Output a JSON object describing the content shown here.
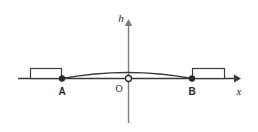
{
  "figure": {
    "background_color": "#ffffff",
    "line_color": "#3a3a3a",
    "label_color": "#2b2b2b"
  },
  "axes": {
    "horizontal": {
      "label": "x",
      "name": "x-axis",
      "x_start": 18,
      "x_end": 240,
      "y": 78,
      "arrow": "right"
    },
    "vertical": {
      "label": "h",
      "name": "h-axis",
      "x": 128,
      "y_top": 20,
      "y_bottom": 123,
      "arrow": "up"
    }
  },
  "origin": {
    "label": "O",
    "marker": "open-circle",
    "x": 128,
    "y": 78,
    "radius": 3
  },
  "points": [
    {
      "label": "A",
      "name": "point-a",
      "x": 62,
      "y": 78,
      "marker": "filled-circle"
    },
    {
      "label": "B",
      "name": "point-b",
      "x": 192,
      "y": 78,
      "marker": "filled-circle"
    }
  ],
  "supports": [
    {
      "name": "left-support-block",
      "x": 30,
      "y": 68,
      "width": 32,
      "height": 11
    },
    {
      "name": "right-support-block",
      "x": 192,
      "y": 68,
      "width": 33,
      "height": 11
    }
  ],
  "curve": {
    "name": "beam-arc",
    "description": "shallow upward arc from A to B peaking near the h-axis",
    "path": "M 62 79 Q 128 66 192 79",
    "apex_x": 128,
    "apex_y": 71
  }
}
